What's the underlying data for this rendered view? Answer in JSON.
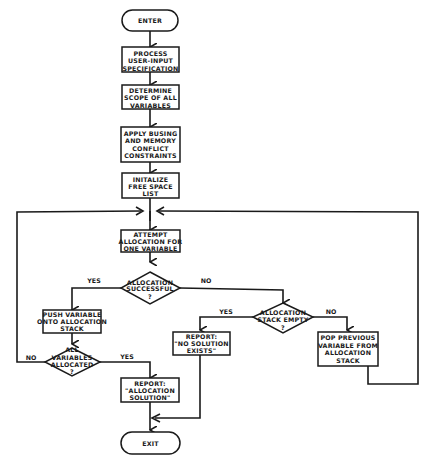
{
  "flowchart": {
    "enter": {
      "label": "ENTER"
    },
    "process_input": {
      "lines": [
        "PROCESS",
        "USER-INPUT",
        "SPECIFICATION"
      ]
    },
    "determine_scope": {
      "lines": [
        "DETERMINE",
        "SCOPE OF ALL",
        "VARIABLES"
      ]
    },
    "apply_constraints": {
      "lines": [
        "APPLY BUSING",
        "AND MEMORY",
        "CONFLICT",
        "CONSTRAINTS"
      ]
    },
    "init_free_space": {
      "lines": [
        "INITALIZE",
        "FREE SPACE",
        "LIST"
      ]
    },
    "attempt_allocation": {
      "lines": [
        "ATTEMPT",
        "ALLOCATION FOR",
        "ONE VARIABLE"
      ]
    },
    "allocation_successful": {
      "lines": [
        "ALLOCATION",
        "SUCCESSFUL",
        "?"
      ]
    },
    "push_variable": {
      "lines": [
        "PUSH VARIABLE",
        "ONTO ALLOCATION",
        "STACK"
      ]
    },
    "all_allocated": {
      "lines": [
        "ALL",
        "VARIABLES",
        "ALLOCATED",
        "?"
      ]
    },
    "report_solution": {
      "lines": [
        "REPORT:",
        "\"ALLOCATION",
        "SOLUTION\""
      ]
    },
    "stack_empty": {
      "lines": [
        "ALLOCATION",
        "STACK EMPTY",
        "?"
      ]
    },
    "report_no_solution": {
      "lines": [
        "REPORT:",
        "\"NO SOLUTION",
        "EXISTS\""
      ]
    },
    "pop_previous": {
      "lines": [
        "POP PREVIOUS",
        "VARIABLE FROM",
        "ALLOCATION",
        "STACK"
      ]
    },
    "exit": {
      "label": "EXIT"
    },
    "edge_labels": {
      "successful_yes": "YES",
      "successful_no": "NO",
      "stack_empty_yes": "YES",
      "stack_empty_no": "NO",
      "all_allocated_no": "NO",
      "all_allocated_yes": "YES"
    }
  }
}
